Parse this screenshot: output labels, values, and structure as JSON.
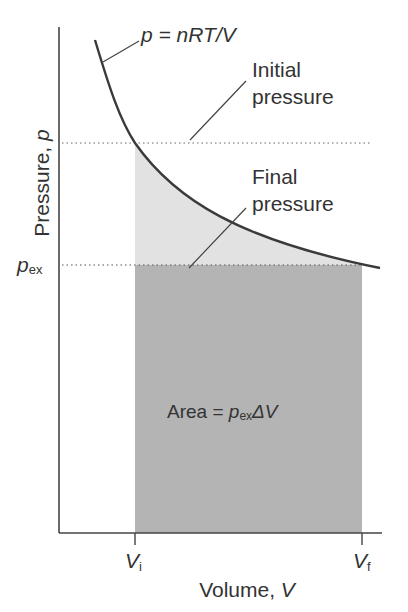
{
  "axes": {
    "y_label_text": "Pressure, ",
    "y_label_var": "p",
    "x_label_text": "Volume, ",
    "x_label_var": "V",
    "y_tick_pex_main": "p",
    "y_tick_pex_sub": "ex",
    "x_tick_vi_main": "V",
    "x_tick_vi_sub": "i",
    "x_tick_vf_main": "V",
    "x_tick_vf_sub": "f"
  },
  "annotations": {
    "isotherm_eq": "p = nRT/V",
    "initial_line1": "Initial",
    "initial_line2": "pressure",
    "final_line1": "Final",
    "final_line2": "pressure",
    "area_prefix": "Area = ",
    "area_p": "p",
    "area_sub": "ex",
    "area_suffix": "ΔV"
  },
  "colors": {
    "curve": "#3a3a3a",
    "axis": "#444444",
    "light_fill": "#e2e2e2",
    "dark_fill": "#b4b4b4",
    "text": "#333333"
  }
}
